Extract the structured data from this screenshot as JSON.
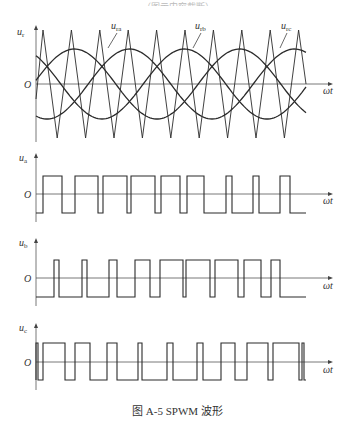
{
  "header_fragment": "……（图示内容截断）……",
  "figure": {
    "caption": "图 A-5   SPWM 波形",
    "x_axis_label": "ωt",
    "origin_label": "O",
    "panels": [
      {
        "id": "reference",
        "y_label_main": "u",
        "y_label_sub": "r",
        "curves": [
          {
            "name": "urа",
            "label_main": "u",
            "label_sub": "ra"
          },
          {
            "name": "urb",
            "label_main": "u",
            "label_sub": "rb"
          },
          {
            "name": "urc",
            "label_main": "u",
            "label_sub": "rc"
          }
        ]
      },
      {
        "id": "ua",
        "y_label_main": "u",
        "y_label_sub": "a"
      },
      {
        "id": "ub",
        "y_label_main": "u",
        "y_label_sub": "b"
      },
      {
        "id": "uc",
        "y_label_main": "u",
        "y_label_sub": "c"
      }
    ]
  },
  "chart_data": [
    {
      "type": "line",
      "title": "Three-phase sinusoidal references with triangular carrier",
      "xlabel": "ωt",
      "ylabel": "u_r",
      "grid": false,
      "series": [
        {
          "name": "u_ra",
          "shape": "sine",
          "phase_deg": 0,
          "amplitude_rel": 0.65
        },
        {
          "name": "u_rb",
          "shape": "sine",
          "phase_deg": -120,
          "amplitude_rel": 0.65
        },
        {
          "name": "u_rc",
          "shape": "sine",
          "phase_deg": 120,
          "amplitude_rel": 0.65
        },
        {
          "name": "carrier",
          "shape": "triangle",
          "periods": 9.5,
          "amplitude_rel": 1.0
        }
      ]
    },
    {
      "type": "line",
      "title": "u_a PWM output",
      "xlabel": "ωt",
      "ylabel": "u_a",
      "levels": [
        "+Ud/2",
        "-Ud/2"
      ],
      "pulse_high_intervals_px": [
        [
          43,
          62
        ],
        [
          75,
          98
        ],
        [
          103,
          127
        ],
        [
          131,
          155
        ],
        [
          161,
          180
        ],
        [
          187,
          204
        ],
        [
          226,
          232
        ],
        [
          253,
          259
        ],
        [
          280,
          290
        ]
      ]
    },
    {
      "type": "line",
      "title": "u_b PWM output",
      "xlabel": "ωt",
      "ylabel": "u_b",
      "levels": [
        "+Ud/2",
        "-Ud/2"
      ],
      "pulse_high_intervals_px": [
        [
          54,
          59
        ],
        [
          82,
          87
        ],
        [
          109,
          117
        ],
        [
          135,
          150
        ],
        [
          160,
          183
        ],
        [
          186,
          210
        ],
        [
          215,
          238
        ],
        [
          244,
          261
        ],
        [
          271,
          280
        ]
      ]
    },
    {
      "type": "line",
      "title": "u_c PWM output",
      "xlabel": "ωt",
      "ylabel": "u_c",
      "levels": [
        "+Ud/2",
        "-Ud/2"
      ],
      "pulse_high_intervals_px": [
        [
          36,
          38
        ],
        [
          43,
          65
        ],
        [
          75,
          90
        ],
        [
          107,
          117
        ],
        [
          138,
          142
        ],
        [
          167,
          173
        ],
        [
          197,
          203
        ],
        [
          221,
          235
        ],
        [
          247,
          268
        ],
        [
          273,
          299
        ],
        [
          302,
          304
        ]
      ]
    }
  ]
}
